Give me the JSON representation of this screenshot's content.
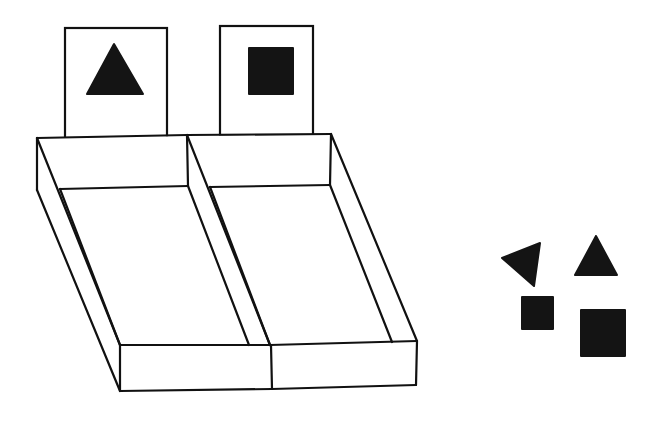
{
  "diagram": {
    "colors": {
      "ink": "#141414",
      "background": "#ffffff"
    },
    "sample_cards": [
      {
        "id": "left",
        "shape": "triangle-icon"
      },
      {
        "id": "right",
        "shape": "square-icon"
      }
    ],
    "tray": {
      "compartments": 2
    },
    "loose_shapes": [
      {
        "shape": "triangle",
        "orientation": "rotated"
      },
      {
        "shape": "triangle",
        "orientation": "upright"
      },
      {
        "shape": "square",
        "size": "small"
      },
      {
        "shape": "square",
        "size": "large"
      }
    ]
  }
}
